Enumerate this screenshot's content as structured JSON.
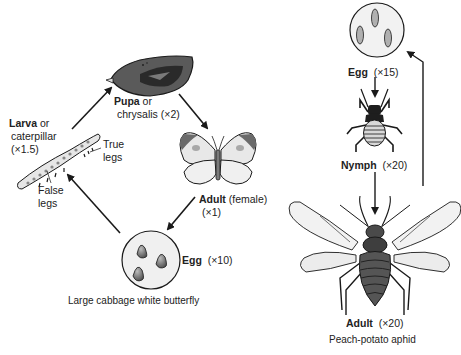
{
  "butterfly_cycle": {
    "title": "Large cabbage white butterfly",
    "stages": {
      "pupa": {
        "name": "Pupa",
        "alt": "or",
        "alt2": "chrysalis",
        "scale": "(×2)"
      },
      "adult": {
        "name": "Adult",
        "qualifier": "(female)",
        "scale": "(×1)"
      },
      "egg": {
        "name": "Egg",
        "scale": "(×10)"
      },
      "larva": {
        "name": "Larva",
        "alt": "or",
        "alt2": "caterpillar",
        "scale": "(×1.5)"
      }
    },
    "annotations": {
      "true_legs": [
        "True",
        "legs"
      ],
      "false_legs": [
        "False",
        "legs"
      ]
    },
    "sequence": [
      "egg",
      "larva",
      "pupa",
      "adult",
      "egg"
    ]
  },
  "aphid_cycle": {
    "title": "Peach-potato aphid",
    "stages": {
      "egg": {
        "name": "Egg",
        "scale": "(×15)"
      },
      "nymph": {
        "name": "Nymph",
        "scale": "(×20)"
      },
      "adult": {
        "name": "Adult",
        "scale": "(×20)"
      }
    },
    "sequence": [
      "egg",
      "nymph",
      "adult",
      "egg"
    ]
  },
  "colors": {
    "line": "#1a1a1a",
    "dark_fill": "#4a4a4a",
    "mid_fill": "#8c8c8c",
    "light_fill": "#e6e6e6",
    "wing_fill": "#f2f2f2"
  }
}
